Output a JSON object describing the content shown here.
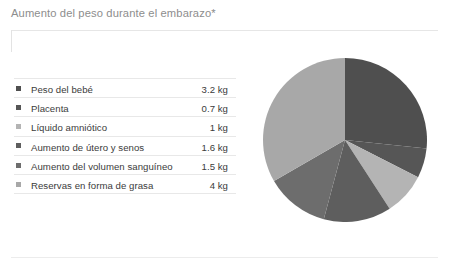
{
  "title": "Aumento del peso durante el embarazo*",
  "units": "kg",
  "legend": {
    "rows": [
      {
        "label": "Peso del bebé",
        "value": "3.2 kg",
        "color": "#4f4f4f"
      },
      {
        "label": "Placenta",
        "value": "0.7 kg",
        "color": "#565656"
      },
      {
        "label": "Líquido amniótico",
        "value": "1 kg",
        "color": "#b4b4b4"
      },
      {
        "label": "Aumento de útero y senos",
        "value": "1.6 kg",
        "color": "#5e5e5e"
      },
      {
        "label": "Aumento del volumen sanguíneo",
        "value": "1.5 kg",
        "color": "#6d6d6d"
      },
      {
        "label": "Reservas en forma de grasa",
        "value": "4 kg",
        "color": "#a8a8a8"
      }
    ]
  },
  "chart_data": {
    "type": "pie",
    "title": "Aumento del peso durante el embarazo*",
    "xlabel": "",
    "ylabel": "",
    "unit": "kg",
    "total": 12,
    "start_angle_deg": 0,
    "direction": "clockwise",
    "legend_position": "left",
    "grid": false,
    "categories": [
      "Peso del bebé",
      "Placenta",
      "Líquido amniótico",
      "Aumento de útero y senos",
      "Aumento del volumen sanguíneo",
      "Reservas en forma de grasa"
    ],
    "values": [
      3.2,
      0.7,
      1,
      1.6,
      1.5,
      4
    ],
    "value_labels": [
      "3.2 kg",
      "0.7 kg",
      "1 kg",
      "1.6 kg",
      "1.5 kg",
      "4 kg"
    ],
    "percentages": [
      26.7,
      5.8,
      8.3,
      13.3,
      12.5,
      33.3
    ],
    "slice_angles_deg": [
      96,
      21,
      30,
      48,
      45,
      120
    ],
    "colors": [
      "#4f4f4f",
      "#565656",
      "#b4b4b4",
      "#5e5e5e",
      "#6d6d6d",
      "#a8a8a8"
    ]
  }
}
